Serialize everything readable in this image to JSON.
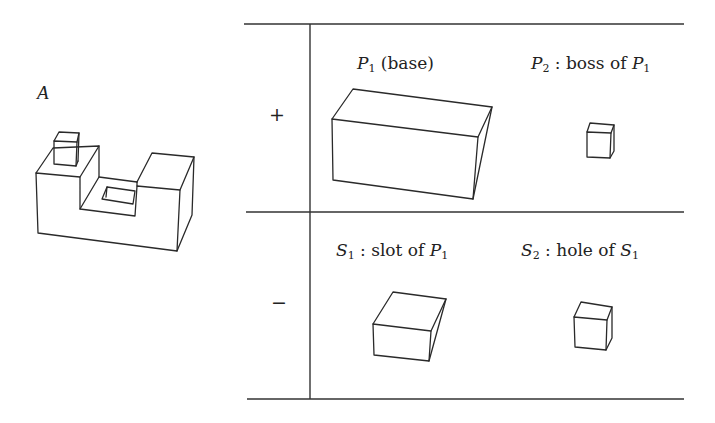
{
  "figure": {
    "object": {
      "label": "A",
      "description": "U-shaped solid with a boss on top of left step and a rectangular hole in the slot floor"
    },
    "table": {
      "rows": [
        {
          "sign": "+",
          "cells": [
            {
              "symbol": "P",
              "subscript": "1",
              "text": " (base)",
              "shape": "long-box"
            },
            {
              "symbol": "P",
              "subscript": "2",
              "text": " : boss of ",
              "ref_symbol": "P",
              "ref_subscript": "1",
              "shape": "small-cube"
            }
          ]
        },
        {
          "sign": "−",
          "cells": [
            {
              "symbol": "S",
              "subscript": "1",
              "text": " : slot of ",
              "ref_symbol": "P",
              "ref_subscript": "1",
              "shape": "medium-box"
            },
            {
              "symbol": "S",
              "subscript": "2",
              "text": " : hole of ",
              "ref_symbol": "S",
              "ref_subscript": "1",
              "shape": "small-cube"
            }
          ]
        }
      ]
    },
    "colors": {
      "ink": "#2a2a2a",
      "background": "#ffffff"
    }
  }
}
